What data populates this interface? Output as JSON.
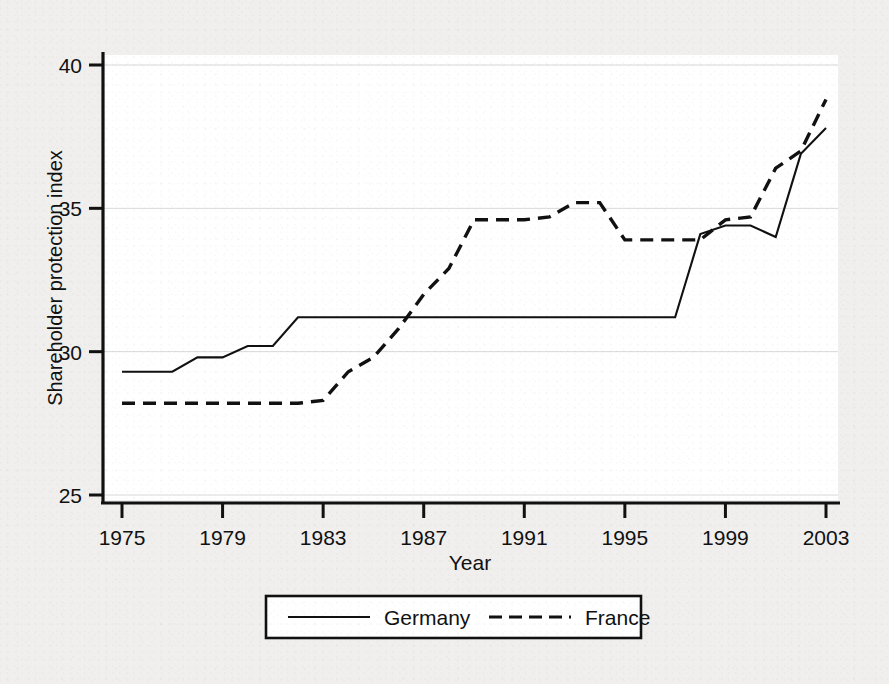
{
  "figure": {
    "background_color": "#f0efee",
    "plot_background_color": "#ffffff",
    "line_color": "#111111",
    "caption": ""
  },
  "chart_data": {
    "type": "line",
    "title": "",
    "xlabel": "Year",
    "ylabel": "Shareholder protection index",
    "xlim": [
      1975,
      2003
    ],
    "ylim": [
      24.2,
      40.6
    ],
    "xticks": [
      1975,
      1979,
      1983,
      1987,
      1991,
      1995,
      1999,
      2003
    ],
    "xtick_labels": [
      "1975",
      "1979",
      "1983",
      "1987",
      "1991",
      "1995",
      "1999",
      "2003"
    ],
    "yticks": [
      25,
      30,
      35,
      40
    ],
    "ytick_labels": [
      "25",
      "30",
      "35",
      "40"
    ],
    "grid": "horizontal-faint",
    "legend_position": "below-axes",
    "x": [
      1975,
      1976,
      1977,
      1978,
      1979,
      1980,
      1981,
      1982,
      1983,
      1984,
      1985,
      1986,
      1987,
      1988,
      1989,
      1990,
      1991,
      1992,
      1993,
      1994,
      1995,
      1996,
      1997,
      1998,
      1999,
      2000,
      2001,
      2002,
      2003
    ],
    "series": [
      {
        "name": "Germany",
        "style": "solid",
        "values": [
          29.3,
          29.3,
          29.3,
          29.8,
          29.8,
          30.2,
          30.2,
          31.2,
          31.2,
          31.2,
          31.2,
          31.2,
          31.2,
          31.2,
          31.2,
          31.2,
          31.2,
          31.2,
          31.2,
          31.2,
          31.2,
          31.2,
          31.2,
          34.1,
          34.4,
          34.4,
          34.0,
          36.9,
          37.8
        ]
      },
      {
        "name": "France",
        "style": "dashed",
        "values": [
          28.2,
          28.2,
          28.2,
          28.2,
          28.2,
          28.2,
          28.2,
          28.2,
          28.3,
          29.3,
          29.8,
          30.8,
          32.0,
          32.9,
          34.6,
          34.6,
          34.6,
          34.7,
          35.2,
          35.2,
          33.9,
          33.9,
          33.9,
          33.9,
          34.6,
          34.7,
          36.4,
          37.0,
          38.8
        ]
      }
    ],
    "legend": [
      {
        "label": "Germany",
        "style": "solid"
      },
      {
        "label": "France",
        "style": "dashed"
      }
    ]
  }
}
